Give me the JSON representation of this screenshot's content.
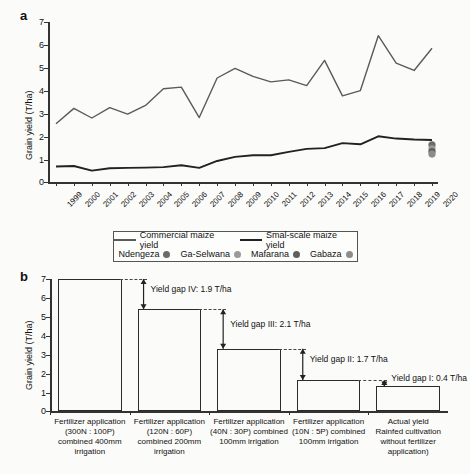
{
  "figure": {
    "panel_a_letter": "a",
    "panel_b_letter": "b"
  },
  "chart_data": [
    {
      "type": "line",
      "panel": "a",
      "title": "",
      "xlabel": "",
      "ylabel": "Grain yield (T/ha)",
      "ylim": [
        0,
        7
      ],
      "yticks": [
        0,
        1,
        2,
        3,
        4,
        5,
        6,
        7
      ],
      "grid": false,
      "legend_position": "below-axes",
      "x": [
        "1999",
        "2000",
        "2001",
        "2002",
        "2003",
        "2004",
        "2005",
        "2006",
        "2007",
        "2008",
        "2009",
        "2010",
        "2011",
        "2012",
        "2013",
        "2014",
        "2015",
        "2016",
        "2017",
        "2018",
        "2019",
        "2020"
      ],
      "series": [
        {
          "name": "Commercial maize yield",
          "color": "#5a5a5a",
          "values": [
            2.55,
            3.22,
            2.8,
            3.25,
            2.97,
            3.35,
            4.08,
            4.15,
            2.82,
            4.55,
            4.97,
            4.62,
            4.38,
            4.47,
            4.22,
            5.32,
            3.77,
            4.0,
            6.4,
            5.2,
            4.88,
            5.85
          ]
        },
        {
          "name": "Smal-scale maize yield",
          "color": "#222222",
          "values": [
            0.68,
            0.7,
            0.5,
            0.6,
            0.62,
            0.63,
            0.65,
            0.73,
            0.62,
            0.92,
            1.1,
            1.17,
            1.17,
            1.32,
            1.45,
            1.48,
            1.7,
            1.65,
            2.0,
            1.9,
            1.86,
            1.84
          ]
        }
      ],
      "scatter_points": [
        {
          "name": "Ndengeza",
          "x": "2020",
          "y": 1.62,
          "color": "#6b6b6b"
        },
        {
          "name": "Ga-Selwana",
          "x": "2020",
          "y": 1.45,
          "color": "#9a9a9a"
        },
        {
          "name": "Mafarana",
          "x": "2020",
          "y": 1.33,
          "color": "#5f5f5f"
        },
        {
          "name": "Gabaza",
          "x": "2020",
          "y": 1.22,
          "color": "#8c8c8c"
        }
      ]
    },
    {
      "type": "bar",
      "panel": "b",
      "title": "",
      "xlabel": "",
      "ylabel": "Grain yield (T/ha)",
      "ylim": [
        0,
        7
      ],
      "yticks": [
        0,
        1,
        2,
        3,
        4,
        5,
        6,
        7
      ],
      "grid": false,
      "categories": [
        "Fertilizer application (300N : 100P) combined 400mm irrigation",
        "Fertilizer application (120N : 60P) combined 200mm irrigation",
        "Fertilizer application (40N : 30P) combined 100mm irrigation",
        "Fertilizer application (10N : 5P) combined 100mm irrigation",
        "Actual yield Rainfed cultivation without fertilizer application)"
      ],
      "values": [
        7.0,
        5.4,
        3.3,
        1.65,
        1.3
      ],
      "annotations": [
        {
          "label": "Yield gap IV: 1.9 T/ha",
          "value": 1.9
        },
        {
          "label": "Yield gap III: 2.1 T/ha",
          "value": 2.1
        },
        {
          "label": "Yield gap II: 1.7 T/ha",
          "value": 1.7
        },
        {
          "label": "Yield gap I: 0.4 T/ha",
          "value": 0.4
        }
      ]
    }
  ],
  "panel_a": {
    "ylabel": "Grain yield (T/ha)",
    "ytick_labels": [
      "7",
      "6",
      "5",
      "4",
      "3",
      "2",
      "1",
      "0"
    ],
    "year_labels": [
      "1999",
      "2000",
      "2001",
      "2002",
      "2003",
      "2004",
      "2005",
      "2006",
      "2007",
      "2008",
      "2009",
      "2010",
      "2011",
      "2012",
      "2013",
      "2014",
      "2015",
      "2016",
      "2017",
      "2018",
      "2019",
      "2020"
    ],
    "legend": {
      "line_items": [
        {
          "label": "Commercial maize yield",
          "color": "#5a5a5a"
        },
        {
          "label": "Smal-scale maize yield",
          "color": "#222222"
        }
      ],
      "point_items": [
        {
          "label": "Ndengeza",
          "color": "#6b6b6b"
        },
        {
          "label": "Ga-Selwana",
          "color": "#9a9a9a"
        },
        {
          "label": "Mafarana",
          "color": "#5f5f5f"
        },
        {
          "label": "Gabaza",
          "color": "#8c8c8c"
        }
      ]
    }
  },
  "panel_b": {
    "ylabel": "Grain yield (T/ha)",
    "ytick_labels": [
      "7",
      "6",
      "5",
      "4",
      "3",
      "2",
      "1",
      "0"
    ],
    "bars": [
      {
        "value": 7.0,
        "lines": [
          "Fertilizer application",
          "(300N : 100P)",
          "combined 400mm",
          "irrigation"
        ]
      },
      {
        "value": 5.4,
        "lines": [
          "Fertilizer application",
          "(120N : 60P)",
          "combined 200mm",
          "irrigation"
        ]
      },
      {
        "value": 3.3,
        "lines": [
          "Fertilizer application",
          "(40N : 30P) combined",
          "100mm irrigation"
        ]
      },
      {
        "value": 1.65,
        "lines": [
          "Fertilizer application",
          "(10N : 5P) combined",
          "100mm irrigation"
        ]
      },
      {
        "value": 1.3,
        "lines": [
          "Actual yield",
          "Rainfed cultivation",
          "without fertilizer",
          "application)"
        ]
      }
    ],
    "gaps": [
      {
        "label": "Yield gap IV: 1.9 T/ha"
      },
      {
        "label": "Yield gap III: 2.1 T/ha"
      },
      {
        "label": "Yield gap II: 1.7 T/ha"
      },
      {
        "label": "Yield gap I: 0.4 T/ha"
      }
    ]
  }
}
